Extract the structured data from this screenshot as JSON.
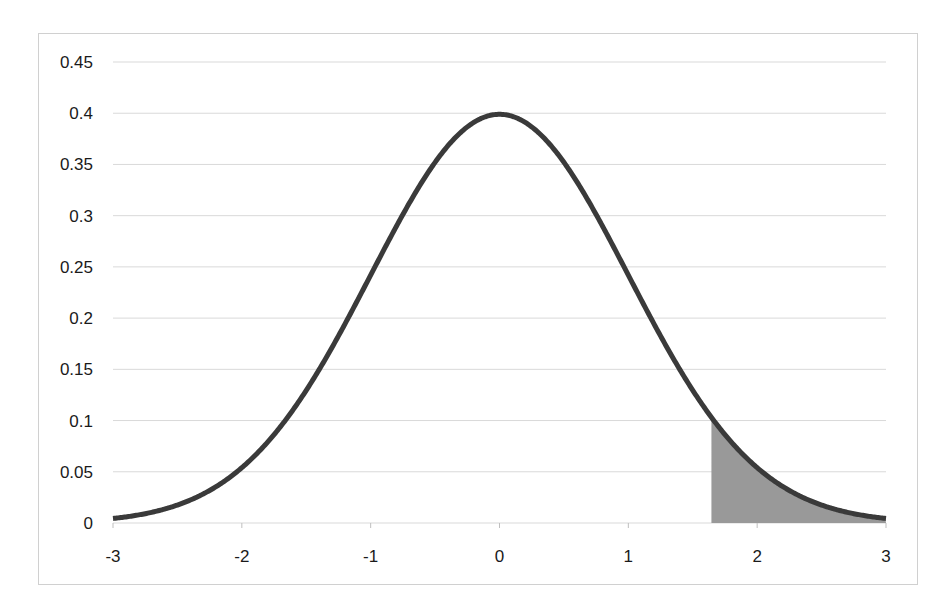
{
  "chart_data": {
    "type": "area",
    "title": "",
    "xlabel": "",
    "ylabel": "",
    "xlim": [
      -3,
      3
    ],
    "ylim": [
      0,
      0.45
    ],
    "grid": true,
    "legend": null,
    "x_ticks": [
      "-3",
      "-2",
      "-1",
      "0",
      "1",
      "2",
      "3"
    ],
    "y_ticks": [
      "0",
      "0.05",
      "0.1",
      "0.15",
      "0.2",
      "0.25",
      "0.3",
      "0.35",
      "0.4",
      "0.45"
    ],
    "series": [
      {
        "name": "Standard normal density",
        "kind": "line",
        "x": [
          -3,
          -2.5,
          -2,
          -1.5,
          -1,
          -0.5,
          0,
          0.5,
          1,
          1.5,
          2,
          2.5,
          3
        ],
        "values": [
          0.0044,
          0.0175,
          0.054,
          0.1295,
          0.242,
          0.3521,
          0.3989,
          0.3521,
          0.242,
          0.1295,
          0.054,
          0.0175,
          0.0044
        ]
      },
      {
        "name": "Shaded upper tail",
        "kind": "area",
        "x_start": 1.645,
        "x_end": 3,
        "y_at_start": 0.1031
      }
    ],
    "colors": {
      "curve": "#3a3a3a",
      "shaded_area": "#999999",
      "gridline": "#d9d9d9"
    }
  }
}
